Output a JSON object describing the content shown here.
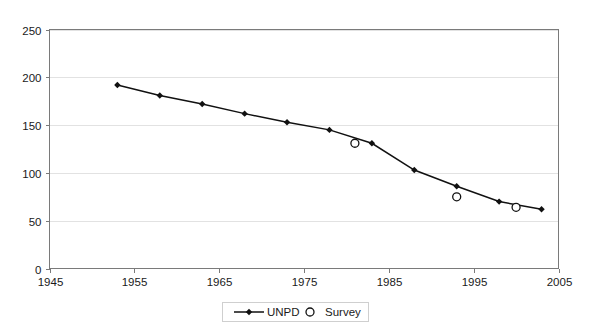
{
  "chart_data": {
    "type": "line",
    "title": "",
    "xlabel": "",
    "ylabel": "",
    "xlim": [
      1945,
      2005
    ],
    "ylim": [
      0,
      250
    ],
    "grid": true,
    "legend_position": "bottom",
    "x_ticks": [
      1945,
      1955,
      1965,
      1975,
      1985,
      1995,
      2005
    ],
    "y_ticks": [
      0,
      50,
      100,
      150,
      200,
      250
    ],
    "x_tick_labels": [
      "1945",
      "1955",
      "1965",
      "1975",
      "1985",
      "1995",
      "2005"
    ],
    "y_tick_labels": [
      "0",
      "50",
      "100",
      "150",
      "200",
      "250"
    ],
    "series": [
      {
        "name": "UNPD",
        "marker": "diamond-filled",
        "line": true,
        "points": [
          {
            "x": 1953,
            "y": 192
          },
          {
            "x": 1958,
            "y": 181
          },
          {
            "x": 1963,
            "y": 172
          },
          {
            "x": 1968,
            "y": 162
          },
          {
            "x": 1973,
            "y": 153
          },
          {
            "x": 1978,
            "y": 145
          },
          {
            "x": 1983,
            "y": 131
          },
          {
            "x": 1988,
            "y": 103
          },
          {
            "x": 1993,
            "y": 86
          },
          {
            "x": 1998,
            "y": 70
          },
          {
            "x": 2003,
            "y": 62
          }
        ]
      },
      {
        "name": "Survey",
        "marker": "circle-open",
        "line": false,
        "points": [
          {
            "x": 1981,
            "y": 131
          },
          {
            "x": 1993,
            "y": 75
          },
          {
            "x": 2000,
            "y": 64
          }
        ]
      }
    ]
  },
  "legend": {
    "items": [
      {
        "label": "UNPD",
        "marker": "line-diamond",
        "color": "#111111"
      },
      {
        "label": "Survey",
        "marker": "circle-open",
        "color": "#111111"
      }
    ]
  },
  "colors": {
    "series_line": "#111111",
    "gridline": "#e2e2e2",
    "axis": "#7a7a7a",
    "background": "#ffffff",
    "text": "#1a1a1a"
  }
}
